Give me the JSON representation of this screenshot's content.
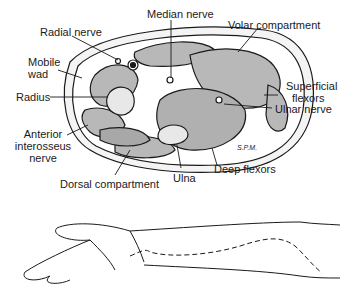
{
  "diagram": {
    "type": "anatomical cross-section",
    "labels": {
      "median_nerve": "Median nerve",
      "radial_nerve": "Radial nerve",
      "volar_compartment": "Volar compartment",
      "mobile_wad_1": "Mobile",
      "mobile_wad_2": "wad",
      "superficial_flexors_1": "Superficial",
      "superficial_flexors_2": "flexors",
      "radius": "Radius",
      "ulnar_nerve": "Ulnar nerve",
      "anterior_interosseus_1": "Anterior",
      "anterior_interosseus_2": "interosseus",
      "anterior_interosseus_3": "nerve",
      "dorsal_compartment": "Dorsal compartment",
      "ulna": "Ulna",
      "deep_flexors": "Deep flexors",
      "signature": "S.P.M."
    },
    "lower_figure": "Forearm outline with dashed incision line"
  },
  "colors": {
    "line": "#1a1a1a",
    "muscle_fill": "#b8b8b8",
    "bone_fill": "#e8e8e8",
    "background": "#ffffff"
  }
}
